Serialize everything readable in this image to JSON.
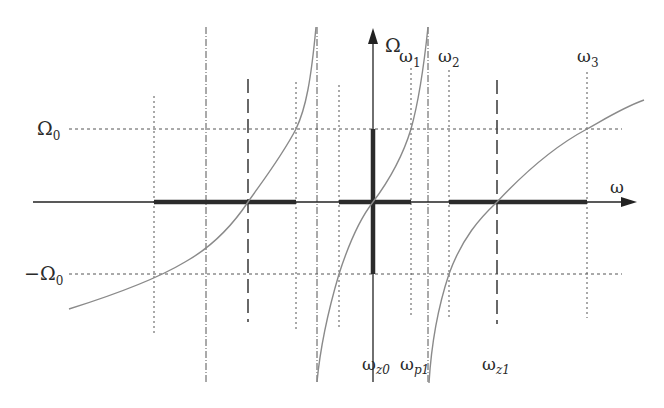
{
  "figure": {
    "type": "frequency-transformation-diagram",
    "axes": {
      "horizontal_label": "ω",
      "vertical_label": "Ω"
    },
    "levels": {
      "omega0_pos": {
        "main": "Ω",
        "sub": "0"
      },
      "omega0_neg": {
        "main": "−Ω",
        "sub": "0"
      }
    },
    "top_labels": [
      {
        "main": "ω",
        "sub": "1"
      },
      {
        "main": "ω",
        "sub": "2"
      },
      {
        "main": "ω",
        "sub": "3"
      }
    ],
    "bottom_labels": [
      {
        "main": "ω",
        "sub": "z0"
      },
      {
        "main": "ω",
        "sub": "p1"
      },
      {
        "main": "ω",
        "sub": "z1"
      }
    ],
    "colors": {
      "axis": "#222222",
      "curve": "#8a8a8a",
      "grid": "#555555",
      "passband": "#2b2b2b"
    }
  }
}
